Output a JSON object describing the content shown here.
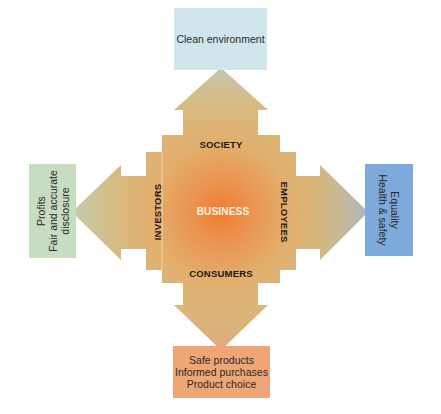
{
  "diagram": {
    "center": {
      "label": "BUSINESS"
    },
    "arms": {
      "top": {
        "label": "SOCIETY",
        "outcome_lines": [
          "Clean environment"
        ],
        "box_color": "#cfe7ec"
      },
      "left": {
        "label": "INVESTORS",
        "outcome_lines": [
          "Profits",
          "Fair and accurate",
          "disclosure"
        ],
        "box_color": "#c8dcc2"
      },
      "right": {
        "label": "EMPLOYEES",
        "outcome_lines": [
          "Equality",
          "Health & safety"
        ],
        "box_color": "#7ea9db"
      },
      "bottom": {
        "label": "CONSUMERS",
        "outcome_lines": [
          "Safe products",
          "Informed purchases",
          "Product choice"
        ],
        "box_color": "#eea676"
      }
    },
    "colors": {
      "center_glow": "#f07a30",
      "body": "#e2b070",
      "arm_tip": "#c9bd8f"
    }
  }
}
